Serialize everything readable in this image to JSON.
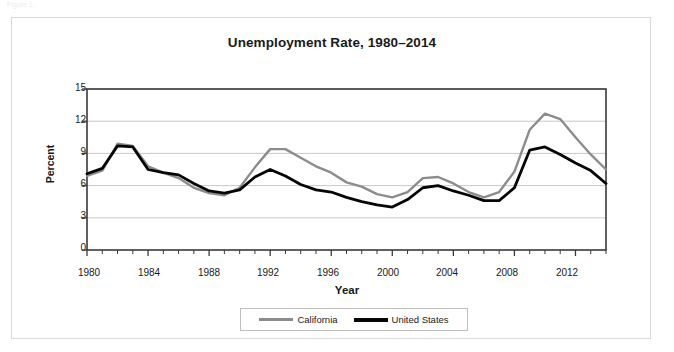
{
  "page": {
    "cropped_header_text": "Figure 1."
  },
  "chart_data": {
    "type": "line",
    "title": "Unemployment Rate, 1980–2014",
    "xlabel": "Year",
    "ylabel": "Percent",
    "xlim": [
      1980,
      2014
    ],
    "ylim": [
      0,
      15
    ],
    "yticks": [
      0,
      3,
      6,
      9,
      12,
      15
    ],
    "xticks": [
      1980,
      1984,
      1988,
      1992,
      1996,
      2000,
      2004,
      2008,
      2012
    ],
    "grid": "horizontal",
    "legend_position": "bottom",
    "x": [
      1980,
      1981,
      1982,
      1983,
      1984,
      1985,
      1986,
      1987,
      1988,
      1989,
      1990,
      1991,
      1992,
      1993,
      1994,
      1995,
      1996,
      1997,
      1998,
      1999,
      2000,
      2001,
      2002,
      2003,
      2004,
      2005,
      2006,
      2007,
      2008,
      2009,
      2010,
      2011,
      2012,
      2013,
      2014
    ],
    "series": [
      {
        "name": "California",
        "color": "#8c8c8c",
        "values": [
          6.9,
          7.4,
          9.9,
          9.7,
          7.8,
          7.2,
          6.7,
          5.8,
          5.3,
          5.1,
          5.8,
          7.7,
          9.4,
          9.4,
          8.6,
          7.8,
          7.2,
          6.3,
          5.9,
          5.2,
          4.9,
          5.4,
          6.7,
          6.8,
          6.2,
          5.4,
          4.9,
          5.4,
          7.3,
          11.2,
          12.7,
          12.2,
          10.5,
          8.9,
          7.5
        ]
      },
      {
        "name": "United States",
        "color": "#050505",
        "values": [
          7.1,
          7.6,
          9.7,
          9.6,
          7.5,
          7.2,
          7.0,
          6.2,
          5.5,
          5.3,
          5.6,
          6.8,
          7.5,
          6.9,
          6.1,
          5.6,
          5.4,
          4.9,
          4.5,
          4.2,
          4.0,
          4.7,
          5.8,
          6.0,
          5.5,
          5.1,
          4.6,
          4.6,
          5.8,
          9.3,
          9.6,
          8.9,
          8.1,
          7.4,
          6.2
        ]
      }
    ]
  },
  "legend": {
    "entries": [
      {
        "label": "California"
      },
      {
        "label": "United States"
      }
    ]
  }
}
